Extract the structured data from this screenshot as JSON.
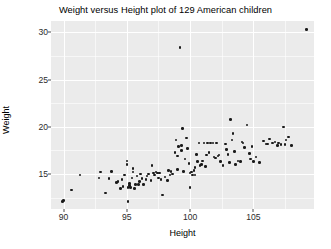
{
  "chart_data": {
    "type": "scatter",
    "title": "Weight versus Height plot of 129 American children",
    "xlabel": "Height",
    "ylabel": "Weight",
    "xlim": [
      89.0,
      109.8
    ],
    "ylim": [
      11.3,
      31.2
    ],
    "xticks": [
      90,
      95,
      100,
      105
    ],
    "yticks": [
      15,
      20,
      25,
      30
    ],
    "xtick_labels": [
      "90",
      "95",
      "100",
      "105"
    ],
    "ytick_labels": [
      "15",
      "20",
      "25",
      "30"
    ],
    "grid": true,
    "grid_major_color": "#ffffff",
    "panel_background": "#ebebeb",
    "point_color": "#1a1a1a",
    "point_count": 129,
    "legend": null,
    "n_label": "129",
    "points": [
      [
        89.9,
        12.1
      ],
      [
        90.0,
        12.2
      ],
      [
        90.6,
        13.3
      ],
      [
        91.3,
        14.9
      ],
      [
        92.8,
        14.6
      ],
      [
        92.9,
        15.2
      ],
      [
        93.3,
        13.0
      ],
      [
        93.6,
        14.5
      ],
      [
        93.8,
        15.3
      ],
      [
        94.2,
        14.1
      ],
      [
        94.3,
        14.2
      ],
      [
        94.5,
        13.5
      ],
      [
        94.6,
        14.4
      ],
      [
        94.7,
        13.7
      ],
      [
        94.8,
        14.9
      ],
      [
        95.0,
        16.4
      ],
      [
        95.0,
        16.0
      ],
      [
        95.1,
        12.1
      ],
      [
        95.1,
        13.6
      ],
      [
        95.2,
        13.8
      ],
      [
        95.2,
        14.0
      ],
      [
        95.3,
        13.6
      ],
      [
        95.4,
        14.6
      ],
      [
        95.5,
        15.6
      ],
      [
        95.5,
        15.2
      ],
      [
        95.6,
        13.5
      ],
      [
        95.7,
        13.9
      ],
      [
        95.8,
        14.8
      ],
      [
        95.9,
        13.9
      ],
      [
        96.0,
        14.2
      ],
      [
        96.2,
        14.5
      ],
      [
        96.3,
        13.9
      ],
      [
        96.5,
        14.4
      ],
      [
        96.6,
        14.8
      ],
      [
        96.7,
        15.0
      ],
      [
        96.9,
        14.3
      ],
      [
        97.0,
        15.9
      ],
      [
        97.1,
        15.1
      ],
      [
        97.2,
        14.9
      ],
      [
        97.3,
        15.2
      ],
      [
        97.4,
        15.1
      ],
      [
        97.5,
        14.6
      ],
      [
        97.6,
        15.1
      ],
      [
        97.7,
        14.4
      ],
      [
        97.8,
        12.8
      ],
      [
        98.0,
        14.7
      ],
      [
        98.2,
        14.3
      ],
      [
        98.3,
        15.4
      ],
      [
        98.4,
        14.9
      ],
      [
        98.5,
        15.3
      ],
      [
        98.6,
        15.0
      ],
      [
        98.8,
        17.3
      ],
      [
        98.9,
        18.6
      ],
      [
        99.0,
        15.5
      ],
      [
        99.1,
        17.9
      ],
      [
        99.2,
        28.4
      ],
      [
        99.3,
        18.0
      ],
      [
        99.3,
        17.5
      ],
      [
        99.4,
        19.8
      ],
      [
        99.5,
        15.3
      ],
      [
        99.6,
        16.6
      ],
      [
        99.7,
        18.8
      ],
      [
        99.8,
        17.7
      ],
      [
        99.9,
        16.1
      ],
      [
        100.0,
        13.6
      ],
      [
        100.0,
        15.1
      ],
      [
        100.1,
        15.2
      ],
      [
        100.2,
        14.9
      ],
      [
        100.3,
        15.4
      ],
      [
        100.4,
        15.7
      ],
      [
        100.5,
        17.1
      ],
      [
        100.6,
        16.3
      ],
      [
        100.7,
        18.3
      ],
      [
        100.8,
        15.9
      ],
      [
        100.9,
        16.0
      ],
      [
        101.0,
        16.4
      ],
      [
        101.1,
        18.3
      ],
      [
        101.2,
        15.8
      ],
      [
        101.3,
        17.0
      ],
      [
        101.4,
        18.3
      ],
      [
        101.6,
        18.3
      ],
      [
        101.8,
        18.3
      ],
      [
        101.9,
        16.8
      ],
      [
        102.0,
        16.7
      ],
      [
        102.1,
        18.3
      ],
      [
        102.2,
        16.9
      ],
      [
        102.3,
        17.0
      ],
      [
        102.4,
        16.3
      ],
      [
        102.6,
        15.9
      ],
      [
        102.8,
        18.2
      ],
      [
        103.0,
        17.1
      ],
      [
        103.1,
        16.2
      ],
      [
        103.2,
        20.8
      ],
      [
        103.3,
        18.6
      ],
      [
        103.4,
        19.3
      ],
      [
        103.5,
        17.4
      ],
      [
        103.6,
        16.0
      ],
      [
        103.8,
        16.4
      ],
      [
        104.0,
        16.3
      ],
      [
        104.1,
        18.4
      ],
      [
        104.2,
        18.3
      ],
      [
        104.3,
        17.8
      ],
      [
        104.5,
        20.2
      ],
      [
        104.7,
        17.2
      ],
      [
        104.8,
        16.6
      ],
      [
        105.0,
        16.3
      ],
      [
        105.2,
        16.8
      ],
      [
        105.5,
        16.2
      ],
      [
        105.8,
        18.5
      ],
      [
        106.0,
        18.2
      ],
      [
        106.1,
        18.2
      ],
      [
        106.3,
        18.7
      ],
      [
        106.5,
        18.3
      ],
      [
        106.7,
        18.4
      ],
      [
        106.9,
        18.0
      ],
      [
        107.0,
        18.3
      ],
      [
        107.2,
        18.1
      ],
      [
        107.4,
        20.0
      ],
      [
        107.5,
        18.1
      ],
      [
        107.6,
        18.6
      ],
      [
        107.8,
        18.9
      ],
      [
        108.0,
        18.0
      ],
      [
        96.1,
        15.0
      ],
      [
        99.0,
        16.9
      ],
      [
        100.4,
        14.9
      ],
      [
        101.5,
        17.3
      ],
      [
        102.9,
        17.6
      ],
      [
        104.9,
        17.9
      ],
      [
        109.2,
        30.3
      ]
    ],
    "outliers": [
      {
        "x": 99.2,
        "y": 28.4
      },
      {
        "x": 109.2,
        "y": 30.3
      }
    ],
    "minor_gridlines_x": [
      92.5,
      97.5,
      102.5,
      107.5
    ],
    "minor_gridlines_y": [
      12.5,
      17.5,
      22.5,
      27.5
    ]
  }
}
